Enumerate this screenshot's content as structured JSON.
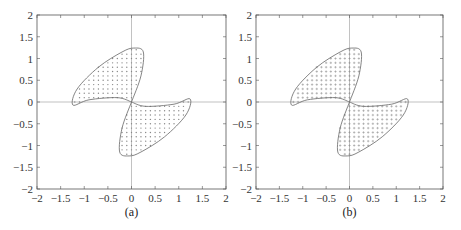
{
  "chart_data": [
    {
      "type": "scatter",
      "panel": "a",
      "caption": "(a)",
      "title": "",
      "xlabel": "",
      "ylabel": "",
      "xlim": [
        -2,
        2
      ],
      "ylim": [
        -2,
        2
      ],
      "x_ticks": [
        "-2",
        "-1.5",
        "-1",
        "-0.5",
        "0",
        "0.5",
        "1",
        "1.5",
        "2"
      ],
      "y_ticks": [
        "2",
        "1.5",
        "1",
        "0.5",
        "0",
        "-0.5",
        "-1",
        "-1.5",
        "-2"
      ],
      "grid": false,
      "zero_axes": true,
      "marker": "dot",
      "regions": [
        {
          "name": "upper-left lobe",
          "outline": [
            [
              0,
              0
            ],
            [
              -0.3,
              0.1
            ],
            [
              -0.9,
              0.05
            ],
            [
              -1.24,
              -0.07
            ],
            [
              -1.15,
              0.3
            ],
            [
              -0.7,
              0.8
            ],
            [
              -0.2,
              1.15
            ],
            [
              0.05,
              1.24
            ],
            [
              0.25,
              1.15
            ],
            [
              0.2,
              0.6
            ],
            [
              0,
              0
            ]
          ]
        },
        {
          "name": "lower-right lobe",
          "outline": [
            [
              0,
              0
            ],
            [
              0.3,
              -0.1
            ],
            [
              0.9,
              -0.05
            ],
            [
              1.24,
              0.07
            ],
            [
              1.15,
              -0.3
            ],
            [
              0.7,
              -0.8
            ],
            [
              0.2,
              -1.15
            ],
            [
              -0.05,
              -1.24
            ],
            [
              -0.25,
              -1.15
            ],
            [
              -0.2,
              -0.6
            ],
            [
              0,
              0
            ]
          ]
        }
      ],
      "grid_spacing": 0.1
    },
    {
      "type": "scatter",
      "panel": "b",
      "caption": "(b)",
      "title": "",
      "xlabel": "",
      "ylabel": "",
      "xlim": [
        -2,
        2
      ],
      "ylim": [
        -2,
        2
      ],
      "x_ticks": [
        "-2",
        "-1.5",
        "-1",
        "-0.5",
        "0",
        "0.5",
        "1",
        "1.5",
        "2"
      ],
      "y_ticks": [
        "2",
        "1.5",
        "1",
        "0.5",
        "0",
        "-0.5",
        "-1",
        "-1.5",
        "-2"
      ],
      "grid": false,
      "zero_axes": true,
      "marker": "plus",
      "regions": [
        {
          "name": "upper-left lobe",
          "outline": [
            [
              0,
              0
            ],
            [
              -0.3,
              0.1
            ],
            [
              -0.9,
              0.05
            ],
            [
              -1.24,
              -0.07
            ],
            [
              -1.15,
              0.3
            ],
            [
              -0.7,
              0.8
            ],
            [
              -0.2,
              1.15
            ],
            [
              0.05,
              1.24
            ],
            [
              0.25,
              1.15
            ],
            [
              0.2,
              0.6
            ],
            [
              0,
              0
            ]
          ]
        },
        {
          "name": "lower-right lobe",
          "outline": [
            [
              0,
              0
            ],
            [
              0.3,
              -0.1
            ],
            [
              0.9,
              -0.05
            ],
            [
              1.24,
              0.07
            ],
            [
              1.15,
              -0.3
            ],
            [
              0.7,
              -0.8
            ],
            [
              0.2,
              -1.15
            ],
            [
              -0.05,
              -1.24
            ],
            [
              -0.25,
              -1.15
            ],
            [
              -0.2,
              -0.6
            ],
            [
              0,
              0
            ]
          ]
        }
      ],
      "grid_spacing": 0.1
    }
  ],
  "style": {
    "axis_color": "#555555",
    "outline_color": "#666666",
    "marker_color": "#888888",
    "zero_line_color": "#999999"
  },
  "layout": {
    "panels": [
      {
        "left": 37,
        "top": 15,
        "right": 226,
        "bottom": 189,
        "caption_y": 216
      },
      {
        "left": 256,
        "top": 15,
        "right": 443,
        "bottom": 189,
        "caption_y": 216
      }
    ]
  }
}
